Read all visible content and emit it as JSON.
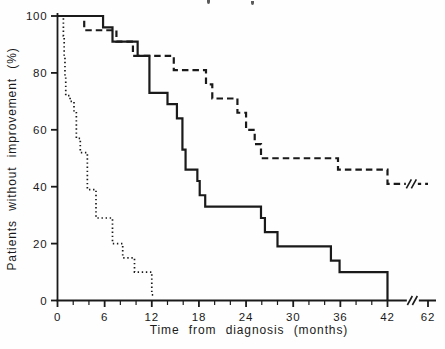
{
  "figure": {
    "background": "#fefefe",
    "ink_color": "#1a1a1a",
    "clipped_title": {
      "legible": false,
      "fragment_count": 2
    }
  },
  "chart_data": {
    "type": "line",
    "subtype": "kaplan-meier-step-curves",
    "title": "",
    "xlabel": "Time from diagnosis (months)",
    "ylabel": "Patients without improvement (%)",
    "xlim": [
      0,
      62
    ],
    "ylim": [
      0,
      100
    ],
    "grid": false,
    "legend": "none",
    "x_axis_break_between": [
      44,
      62
    ],
    "x_ticks_major": [
      0,
      6,
      12,
      18,
      24,
      30,
      36,
      42,
      62
    ],
    "x_ticks_minor": [
      2,
      4,
      8,
      10,
      14,
      16,
      20,
      22,
      26,
      28,
      32,
      34,
      38,
      40
    ],
    "y_ticks": [
      0,
      20,
      40,
      60,
      80,
      100
    ],
    "series": [
      {
        "name": "dotted-curve",
        "line_style": "dotted",
        "color": "#1a1a1a",
        "points": [
          [
            0,
            100
          ],
          [
            0.75,
            93
          ],
          [
            0.85,
            86
          ],
          [
            0.95,
            79
          ],
          [
            1.05,
            72
          ],
          [
            1.6,
            70
          ],
          [
            2.1,
            66
          ],
          [
            2.4,
            57
          ],
          [
            2.9,
            52
          ],
          [
            3.8,
            39
          ],
          [
            4.9,
            29
          ],
          [
            7.0,
            20
          ],
          [
            8.3,
            15
          ],
          [
            9.8,
            10
          ],
          [
            12.0,
            2
          ]
        ],
        "end_x": 12.3
      },
      {
        "name": "solid-curve",
        "line_style": "solid",
        "color": "#1a1a1a",
        "points": [
          [
            0,
            100
          ],
          [
            5.8,
            96
          ],
          [
            7.0,
            91
          ],
          [
            10.2,
            86
          ],
          [
            11.7,
            73
          ],
          [
            14.0,
            69
          ],
          [
            15.2,
            64
          ],
          [
            15.9,
            53
          ],
          [
            16.3,
            46
          ],
          [
            17.8,
            42
          ],
          [
            18.1,
            37
          ],
          [
            18.8,
            33
          ],
          [
            25.9,
            29
          ],
          [
            26.4,
            24
          ],
          [
            28.0,
            19
          ],
          [
            34.8,
            14
          ],
          [
            35.9,
            10
          ],
          [
            42.0,
            0
          ]
        ],
        "end_x": 42.0
      },
      {
        "name": "dashed-curve",
        "line_style": "dashed",
        "color": "#1a1a1a",
        "points": [
          [
            0,
            100
          ],
          [
            3.4,
            95
          ],
          [
            7.5,
            91
          ],
          [
            9.6,
            86
          ],
          [
            14.8,
            81
          ],
          [
            18.9,
            76
          ],
          [
            19.7,
            71
          ],
          [
            22.9,
            66
          ],
          [
            24.0,
            60
          ],
          [
            25.1,
            55
          ],
          [
            25.9,
            50
          ],
          [
            35.7,
            46
          ],
          [
            42.0,
            41
          ]
        ],
        "end_x": 62,
        "curve_break_at_percent": 41
      }
    ]
  }
}
